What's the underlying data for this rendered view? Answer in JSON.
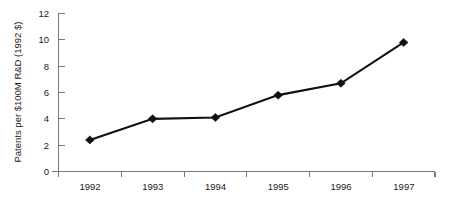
{
  "chart_data": {
    "type": "line",
    "title": "",
    "subtitle": "",
    "xlabel": "",
    "ylabel": "Patents per $100M R&D (1992 $)",
    "categories": [
      "1992",
      "1993",
      "1994",
      "1995",
      "1996",
      "1997"
    ],
    "values": [
      2.4,
      4.0,
      4.1,
      5.8,
      6.7,
      9.8
    ],
    "series": [
      {
        "name": "Patents per $100M R&D",
        "values": [
          2.4,
          4.0,
          4.1,
          5.8,
          6.7,
          9.8
        ]
      }
    ],
    "x": [
      "1992",
      "1993",
      "1994",
      "1995",
      "1996",
      "1997"
    ],
    "ylim": [
      0,
      12
    ],
    "y_ticks": [
      0,
      2,
      4,
      6,
      8,
      10,
      12
    ],
    "y_tick_labels": [
      "0",
      "2",
      "4",
      "6",
      "8",
      "10",
      "12"
    ],
    "grid": false,
    "legend": false,
    "legend_position": "none",
    "marker": "diamond",
    "line_color": "#111111",
    "marker_color": "#111111",
    "axis_color": "#7a7a7a",
    "background_color": "#ffffff",
    "annotations": []
  }
}
